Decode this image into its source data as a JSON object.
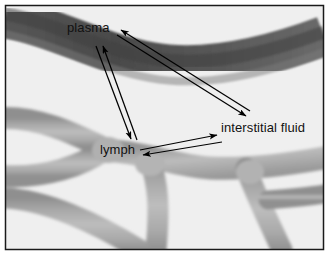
{
  "figure": {
    "width": 329,
    "height": 255,
    "background_color": "#efefef",
    "border_color": "#1a1a1a"
  },
  "labels": {
    "plasma": "plasma",
    "lymph": "lymph",
    "interstitial": "interstitial fluid"
  },
  "colors": {
    "background": "#efefef",
    "blood_vessel_dark": "#4a4a4a",
    "blood_vessel_mid": "#5f5f5f",
    "blood_vessel_light": "#7a7a7a",
    "lymph_vessel_dark": "#8c8c8c",
    "lymph_vessel_light": "#c9c9c9",
    "arrow": "#000000",
    "text": "#111111"
  },
  "structures": [
    {
      "name": "blood-capillary",
      "label": "plasma",
      "description": "dark gray blood vessel crossing upper portion of image from left to right"
    },
    {
      "name": "lymph-vessel-network",
      "label": "lymph",
      "description": "light gray branching lymphatic vessels filling lower portion of image"
    },
    {
      "name": "interstitial-space",
      "label": "interstitial fluid",
      "description": "pale background region between vessels"
    }
  ],
  "arrows": [
    {
      "name": "plasma-to-lymph",
      "from": "plasma",
      "to": "lymph",
      "direction": "down-left",
      "head": "end"
    },
    {
      "name": "lymph-to-plasma",
      "from": "lymph",
      "to": "plasma",
      "direction": "up-right",
      "head": "end"
    },
    {
      "name": "plasma-to-interstitial",
      "from": "plasma",
      "to": "interstitial fluid",
      "direction": "down-right",
      "head": "end"
    },
    {
      "name": "interstitial-to-plasma",
      "from": "interstitial fluid",
      "to": "plasma",
      "direction": "up-left",
      "head": "end"
    },
    {
      "name": "lymph-to-interstitial",
      "from": "lymph",
      "to": "interstitial fluid",
      "direction": "right",
      "head": "end"
    },
    {
      "name": "interstitial-to-lymph",
      "from": "interstitial fluid",
      "to": "lymph",
      "direction": "left",
      "head": "end"
    }
  ]
}
